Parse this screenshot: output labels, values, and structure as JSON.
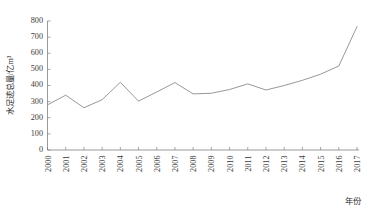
{
  "chart_data": {
    "type": "line",
    "title": "",
    "xlabel": "年份",
    "ylabel": "水足迹总量/亿m³",
    "categories": [
      "2000",
      "2001",
      "2002",
      "2003",
      "2004",
      "2005",
      "2006",
      "2007",
      "2008",
      "2009",
      "2010",
      "2011",
      "2012",
      "2013",
      "2014",
      "2015",
      "2016",
      "2017"
    ],
    "values": [
      280,
      340,
      262,
      312,
      420,
      303,
      360,
      418,
      348,
      352,
      375,
      410,
      372,
      400,
      432,
      470,
      521,
      765
    ],
    "series": [
      {
        "name": "水足迹总量",
        "values": [
          280,
          340,
          262,
          312,
          420,
          303,
          360,
          418,
          348,
          352,
          375,
          410,
          372,
          400,
          432,
          470,
          521,
          765
        ]
      }
    ],
    "ylim": [
      0,
      800
    ],
    "ytick_labels": [
      "0",
      "100",
      "200",
      "300",
      "400",
      "500",
      "600",
      "700",
      "800"
    ],
    "ytick_values": [
      0,
      100,
      200,
      300,
      400,
      500,
      600,
      700,
      800
    ],
    "xtick_labels": [
      "2000",
      "2001",
      "2002",
      "2003",
      "2004",
      "2005",
      "2006",
      "2007",
      "2008",
      "2009",
      "2010",
      "2011",
      "2012",
      "2013",
      "2014",
      "2015",
      "2016",
      "2017"
    ],
    "grid": false,
    "legend": "none",
    "line_color": "#8c8c8c",
    "axis_color": "#808080",
    "text_color": "#3a3a3a",
    "background_color": "#ffffff"
  }
}
